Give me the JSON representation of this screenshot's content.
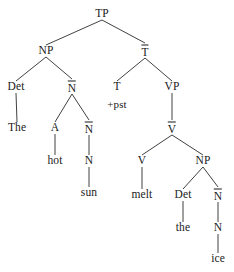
{
  "figure": {
    "type": "syntax-tree",
    "sentence": "The hot sun melt the ice",
    "background_color": "#ffffff",
    "line_color": "#2b2b2b",
    "text_color": "#1a1a1a"
  },
  "nodes": [
    {
      "id": "TP",
      "label": "TP",
      "bar": false,
      "x": 102,
      "y": 14
    },
    {
      "id": "NP1",
      "label": "NP",
      "bar": false,
      "x": 46,
      "y": 51
    },
    {
      "id": "Tbar",
      "label": "T",
      "bar": true,
      "x": 145,
      "y": 51
    },
    {
      "id": "Det1",
      "label": "Det",
      "bar": false,
      "x": 16,
      "y": 87
    },
    {
      "id": "Nbar1",
      "label": "N",
      "bar": true,
      "x": 72,
      "y": 87
    },
    {
      "id": "T",
      "label": "T",
      "bar": false,
      "x": 117,
      "y": 87
    },
    {
      "id": "VP",
      "label": "VP",
      "bar": false,
      "x": 172,
      "y": 87
    },
    {
      "id": "The",
      "label": "The",
      "bar": false,
      "x": 17,
      "y": 128
    },
    {
      "id": "A",
      "label": "A",
      "bar": false,
      "x": 55,
      "y": 128
    },
    {
      "id": "Nbar2",
      "label": "N",
      "bar": true,
      "x": 89,
      "y": 128
    },
    {
      "id": "pst",
      "label": "+pst",
      "bar": false,
      "x": 117,
      "y": 104,
      "feature": true
    },
    {
      "id": "Vbar",
      "label": "V",
      "bar": true,
      "x": 172,
      "y": 128
    },
    {
      "id": "hot",
      "label": "hot",
      "bar": false,
      "x": 55,
      "y": 161
    },
    {
      "id": "N1",
      "label": "N",
      "bar": false,
      "x": 89,
      "y": 161
    },
    {
      "id": "V",
      "label": "V",
      "bar": false,
      "x": 142,
      "y": 161
    },
    {
      "id": "NP2",
      "label": "NP",
      "bar": false,
      "x": 203,
      "y": 161
    },
    {
      "id": "sun",
      "label": "sun",
      "bar": false,
      "x": 89,
      "y": 193
    },
    {
      "id": "melt",
      "label": "melt",
      "bar": false,
      "x": 142,
      "y": 195
    },
    {
      "id": "Det2",
      "label": "Det",
      "bar": false,
      "x": 183,
      "y": 195
    },
    {
      "id": "Nbar3",
      "label": "N",
      "bar": true,
      "x": 218,
      "y": 195
    },
    {
      "id": "the",
      "label": "the",
      "bar": false,
      "x": 183,
      "y": 228
    },
    {
      "id": "N2",
      "label": "N",
      "bar": false,
      "x": 218,
      "y": 228
    },
    {
      "id": "ice",
      "label": "ice",
      "bar": false,
      "x": 218,
      "y": 259
    }
  ],
  "edges": [
    {
      "from": "TP",
      "to": "NP1"
    },
    {
      "from": "TP",
      "to": "Tbar"
    },
    {
      "from": "NP1",
      "to": "Det1"
    },
    {
      "from": "NP1",
      "to": "Nbar1"
    },
    {
      "from": "Tbar",
      "to": "T"
    },
    {
      "from": "Tbar",
      "to": "VP"
    },
    {
      "from": "Det1",
      "to": "The"
    },
    {
      "from": "Nbar1",
      "to": "A"
    },
    {
      "from": "Nbar1",
      "to": "Nbar2"
    },
    {
      "from": "VP",
      "to": "Vbar"
    },
    {
      "from": "A",
      "to": "hot"
    },
    {
      "from": "Nbar2",
      "to": "N1"
    },
    {
      "from": "Vbar",
      "to": "V"
    },
    {
      "from": "Vbar",
      "to": "NP2"
    },
    {
      "from": "N1",
      "to": "sun"
    },
    {
      "from": "V",
      "to": "melt"
    },
    {
      "from": "NP2",
      "to": "Det2"
    },
    {
      "from": "NP2",
      "to": "Nbar3"
    },
    {
      "from": "Det2",
      "to": "the"
    },
    {
      "from": "Nbar3",
      "to": "N2"
    },
    {
      "from": "N2",
      "to": "ice"
    }
  ]
}
